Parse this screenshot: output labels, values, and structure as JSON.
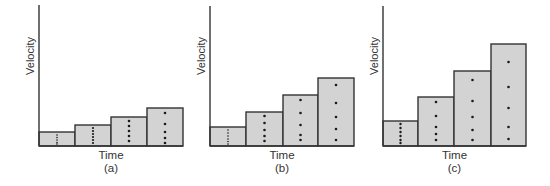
{
  "figure": {
    "colors": {
      "bar_fill": "#d3d3d3",
      "stroke": "#333333",
      "dot": "#1a1a1a",
      "background": "#ffffff"
    },
    "panels": [
      {
        "id": "a",
        "label": "(a)",
        "x_axis_label": "Time",
        "y_axis_label": "Velocity",
        "axis": {
          "x": 39,
          "top": 5,
          "baseline": 146,
          "right": 183
        },
        "bars": [
          {
            "x0": 39,
            "x1": 75,
            "top": 132,
            "dots": [
              135,
              137.5,
              140,
              142.5,
              144
            ],
            "dot_r": 0.8
          },
          {
            "x0": 75,
            "x1": 111,
            "top": 125,
            "dots": [
              128,
              131,
              134,
              137,
              140,
              143
            ],
            "dot_r": 1.1
          },
          {
            "x0": 111,
            "x1": 147,
            "top": 117,
            "dots": [
              121,
              126,
              131,
              136,
              141
            ],
            "dot_r": 1.3
          },
          {
            "x0": 147,
            "x1": 183,
            "top": 108,
            "dots": [
              113,
              124,
              132,
              138,
              143
            ],
            "dot_r": 1.3
          }
        ]
      },
      {
        "id": "b",
        "label": "(b)",
        "x_axis_label": "Time",
        "y_axis_label": "Velocity",
        "axis": {
          "x": 210,
          "top": 6,
          "baseline": 146,
          "right": 354
        },
        "bars": [
          {
            "x0": 210,
            "x1": 246,
            "top": 127,
            "dots": [
              130,
              133,
              136,
              139,
              141.5,
              144
            ],
            "dot_r": 0.8
          },
          {
            "x0": 246,
            "x1": 283,
            "top": 112,
            "dots": [
              116,
              123,
              130,
              136,
              141
            ],
            "dot_r": 1.3
          },
          {
            "x0": 283,
            "x1": 318,
            "top": 95,
            "dots": [
              100,
              113,
              125,
              135,
              140
            ],
            "dot_r": 1.3
          },
          {
            "x0": 318,
            "x1": 354,
            "top": 78,
            "dots": [
              85,
              103,
              117,
              129,
              140
            ],
            "dot_r": 1.3
          }
        ]
      },
      {
        "id": "c",
        "label": "(c)",
        "x_axis_label": "Time",
        "y_axis_label": "Velocity",
        "axis": {
          "x": 383,
          "top": 6,
          "baseline": 146,
          "right": 526
        },
        "bars": [
          {
            "x0": 383,
            "x1": 418,
            "top": 121,
            "dots": [
              124,
              128,
              132,
              136,
              140,
              143
            ],
            "dot_r": 1.2
          },
          {
            "x0": 418,
            "x1": 454,
            "top": 97,
            "dots": [
              102,
              116,
              127,
              134,
              140
            ],
            "dot_r": 1.3
          },
          {
            "x0": 454,
            "x1": 491,
            "top": 71,
            "dots": [
              80,
              101,
              117,
              130,
              140
            ],
            "dot_r": 1.3
          },
          {
            "x0": 491,
            "x1": 526,
            "top": 44,
            "dots": [
              62,
              87,
              108,
              127,
              139
            ],
            "dot_r": 1.3
          }
        ]
      }
    ]
  }
}
